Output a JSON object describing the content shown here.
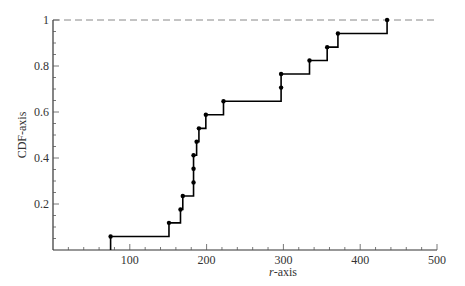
{
  "chart_data": {
    "type": "line",
    "subtype": "empirical-cdf-step",
    "title": "",
    "xlabel": "r-axis",
    "ylabel": "CDF-axis",
    "xlim": [
      0,
      500
    ],
    "ylim": [
      0,
      1
    ],
    "xticks": [
      100,
      200,
      300,
      400,
      500
    ],
    "yticks": [
      0.2,
      0.4,
      0.6,
      0.8,
      1
    ],
    "xtick_labels": [
      "100",
      "200",
      "300",
      "400",
      "500"
    ],
    "ytick_labels": [
      "0.2",
      "0.4",
      "0.6",
      "0.8",
      "1"
    ],
    "grid": false,
    "reference_line": {
      "y": 1,
      "style": "dashed",
      "color": "#888888"
    },
    "series": [
      {
        "name": "CDF",
        "color": "#000000",
        "x": [
          75,
          151,
          166,
          169,
          183,
          183,
          183,
          187,
          190,
          199,
          222,
          297,
          297,
          334,
          357,
          371,
          435
        ],
        "y": [
          0.059,
          0.118,
          0.176,
          0.235,
          0.294,
          0.353,
          0.412,
          0.471,
          0.529,
          0.588,
          0.647,
          0.706,
          0.765,
          0.824,
          0.882,
          0.941,
          1.0
        ]
      }
    ]
  }
}
